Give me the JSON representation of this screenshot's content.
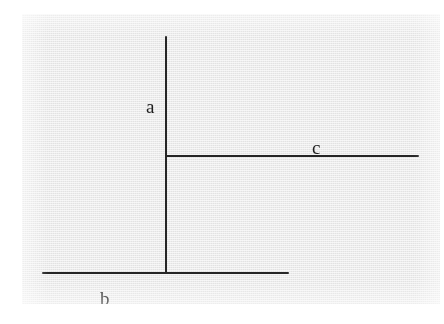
{
  "figure": {
    "background_color": "#ffffff",
    "panel_color": "#e9e9e9",
    "ink_color": "#262626",
    "labels": [
      {
        "id": "a",
        "text": "a",
        "position": "left of upper vertical segment"
      },
      {
        "id": "b",
        "text": "b",
        "position": "below left portion of bottom horizontal segment"
      },
      {
        "id": "c",
        "text": "c",
        "position": "above right portion of middle horizontal segment"
      }
    ],
    "segments": [
      {
        "id": "a",
        "orientation": "vertical",
        "label": "a"
      },
      {
        "id": "c",
        "orientation": "horizontal",
        "label": "c"
      },
      {
        "id": "b",
        "orientation": "horizontal",
        "label": "b"
      }
    ]
  }
}
